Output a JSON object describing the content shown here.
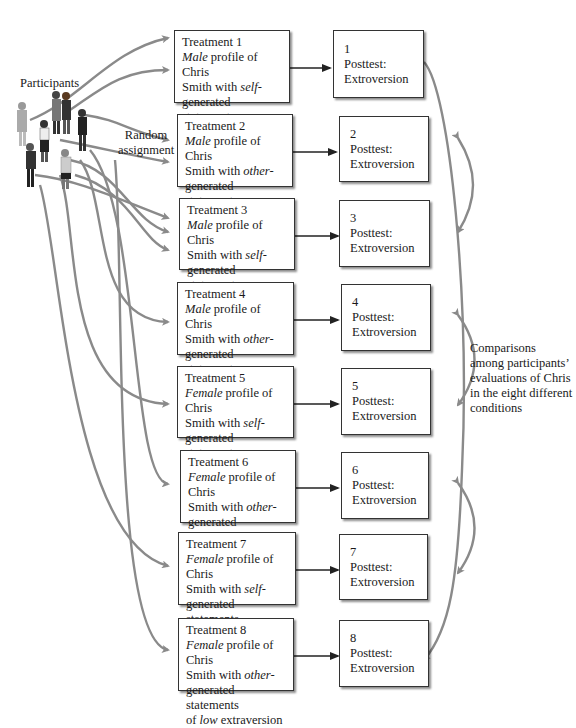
{
  "labels": {
    "participants": "Participants",
    "random_assignment": [
      "Random",
      "assignment"
    ],
    "comparisons": [
      "Comparisons",
      "among participants’",
      "evaluations of Chris",
      "in the eight different",
      "conditions"
    ]
  },
  "treatments": [
    {
      "title": "Treatment 1",
      "gender": "Male",
      "source": "self",
      "level": "high"
    },
    {
      "title": "Treatment 2",
      "gender": "Male",
      "source": "other",
      "level": "high"
    },
    {
      "title": "Treatment 3",
      "gender": "Male",
      "source": "self",
      "level": "low"
    },
    {
      "title": "Treatment 4",
      "gender": "Male",
      "source": "other",
      "level": "low"
    },
    {
      "title": "Treatment 5",
      "gender": "Female",
      "source": "self",
      "level": "high"
    },
    {
      "title": "Treatment 6",
      "gender": "Female",
      "source": "other",
      "level": "high"
    },
    {
      "title": "Treatment 7",
      "gender": "Female",
      "source": "self",
      "level": "low"
    },
    {
      "title": "Treatment 8",
      "gender": "Female",
      "source": "other",
      "level": "low"
    }
  ],
  "text_parts": {
    "profile_of": " profile of Chris",
    "smith_with": "Smith with ",
    "dash": "-",
    "generated": "generated statements",
    "of": "of ",
    "extraversion": " extraversion"
  },
  "posttests": [
    {
      "num": "1",
      "line1": "Posttest:",
      "line2": "Extroversion"
    },
    {
      "num": "2",
      "line1": "Posttest:",
      "line2": "Extroversion"
    },
    {
      "num": "3",
      "line1": "Posttest:",
      "line2": "Extroversion"
    },
    {
      "num": "4",
      "line1": "Posttest:",
      "line2": "Extroversion"
    },
    {
      "num": "5",
      "line1": "Posttest:",
      "line2": "Extroversion"
    },
    {
      "num": "6",
      "line1": "Posttest:",
      "line2": "Extroversion"
    },
    {
      "num": "7",
      "line1": "Posttest:",
      "line2": "Extroversion"
    },
    {
      "num": "8",
      "line1": "Posttest:",
      "line2": "Extroversion"
    }
  ],
  "colors": {
    "arrow_gray": "#8a8a8a",
    "box_border": "#333333",
    "text": "#1a1a1a"
  }
}
